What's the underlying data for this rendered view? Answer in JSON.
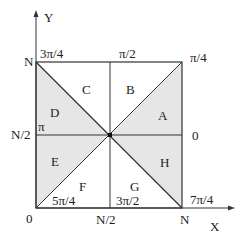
{
  "diagram": {
    "axes": {
      "x_label": "X",
      "y_label": "Y"
    },
    "corner_labels": {
      "origin": "0",
      "top_left_y": "N",
      "mid_left_y": "N/2",
      "mid_bottom_x": "N/2",
      "bottom_right_x": "N"
    },
    "angle_labels": {
      "top_left": "3π/4",
      "top_mid": "π/2",
      "top_right": "π/4",
      "left_mid": "π",
      "right_mid": "0",
      "bottom_left": "5π/4",
      "bottom_mid": "3π/2",
      "bottom_right": "7π/4"
    },
    "regions": {
      "A": "A",
      "B": "B",
      "C": "C",
      "D": "D",
      "E": "E",
      "F": "F",
      "G": "G",
      "H": "H"
    },
    "colors": {
      "shaded": "#e6e6e6",
      "line": "#333333"
    }
  }
}
